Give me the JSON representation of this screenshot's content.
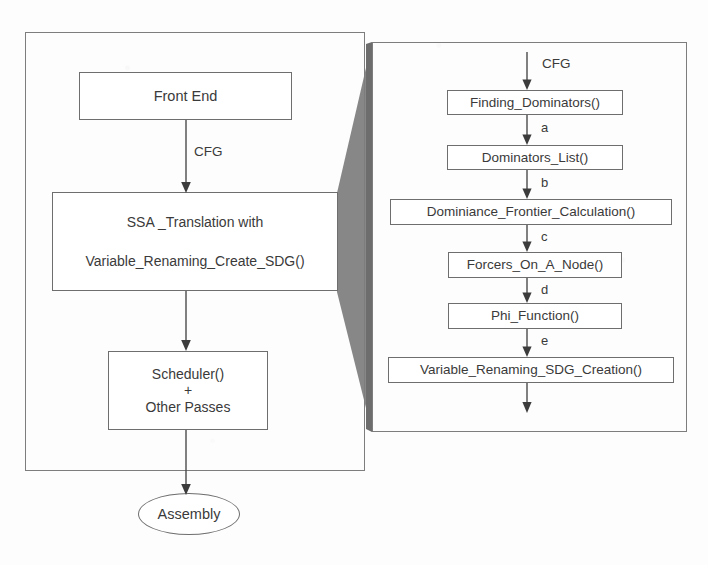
{
  "diagram": {
    "colors": {
      "wedge_gray": "#878787",
      "wedge_shadow": "#6d6d6d",
      "stroke": "#6e6e6e",
      "text": "#3a3a3a",
      "background": "#ffffff"
    }
  },
  "left_panel": {
    "name": "compiler-pipeline-panel",
    "nodes": [
      {
        "id": "front-end",
        "lines": [
          "Front End"
        ]
      },
      {
        "id": "ssa-translation",
        "lines": [
          "SSA _Translation with",
          "Variable_Renaming_Create_SDG()"
        ]
      },
      {
        "id": "scheduler",
        "lines": [
          "Scheduler()",
          "+",
          "Other Passes"
        ]
      }
    ],
    "terminal": {
      "id": "assembly",
      "label": "Assembly"
    },
    "edge_labels": [
      {
        "id": "front-end-to-ssa",
        "label": "CFG"
      }
    ]
  },
  "right_panel": {
    "name": "ssa-translation-detail-panel",
    "entry_label": "CFG",
    "nodes": [
      {
        "id": "finding-dominators",
        "label": "Finding_Dominators()"
      },
      {
        "id": "dominators-list",
        "label": "Dominators_List()"
      },
      {
        "id": "dominiance-frontier-calculation",
        "label": "Dominiance_Frontier_Calculation()"
      },
      {
        "id": "forcers-on-a-node",
        "label": "Forcers_On_A_Node()"
      },
      {
        "id": "phi-function",
        "label": "Phi_Function()"
      },
      {
        "id": "variable-renaming-sdg-creation",
        "label": "Variable_Renaming_SDG_Creation()"
      }
    ],
    "edge_labels": [
      {
        "id": "edge-a",
        "label": "a"
      },
      {
        "id": "edge-b",
        "label": "b"
      },
      {
        "id": "edge-c",
        "label": "c"
      },
      {
        "id": "edge-d",
        "label": "d"
      },
      {
        "id": "edge-e",
        "label": "e"
      }
    ]
  }
}
